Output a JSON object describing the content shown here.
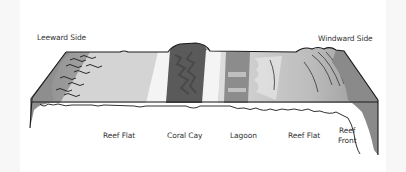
{
  "diagram": {
    "type": "cross-section",
    "side_labels": {
      "left": "Leeward Side",
      "right": "Windward Side"
    },
    "zone_labels": [
      {
        "id": "reef-flat-left",
        "text": "Reef Flat"
      },
      {
        "id": "coral-cay",
        "text": "Coral Cay"
      },
      {
        "id": "lagoon",
        "text": "Lagoon"
      },
      {
        "id": "reef-flat-right",
        "text": "Reef Flat"
      },
      {
        "id": "reef-front",
        "text": "Reef\nFront",
        "line1": "Reef",
        "line2": "Front"
      }
    ],
    "colors": {
      "outline": "#1a1a1a",
      "reef_flat_light": "#d6d6d6",
      "reef_flat_mid": "#bdbdbd",
      "cay_dark": "#555555",
      "sand_white": "#f5f5f5",
      "lagoon_gray": "#8c8c8c",
      "slope_gray": "#8a8a8a",
      "background": "#ffffff"
    }
  }
}
